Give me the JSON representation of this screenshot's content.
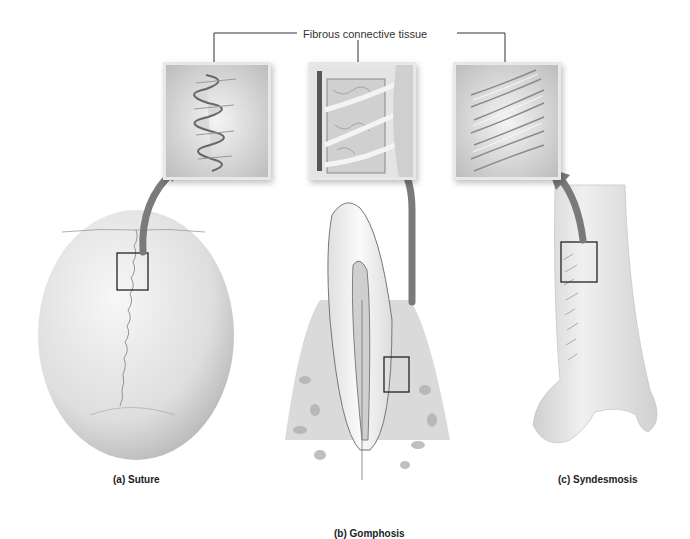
{
  "figure": {
    "callout": {
      "label": "Fibrous connective tissue"
    },
    "panels": [
      {
        "id": "a",
        "caption": "(a) Suture",
        "structure": "skull",
        "inset": "interlocking suture fibers"
      },
      {
        "id": "b",
        "caption": "(b) Gomphosis",
        "structure": "tooth in alveolar bone",
        "inset": "periodontal ligament fibers"
      },
      {
        "id": "c",
        "caption": "(c) Syndesmosis",
        "structure": "tibia and fibula",
        "inset": "interosseous membrane fibers"
      }
    ],
    "colors": {
      "background": "#ffffff",
      "bone": "#e6e6e6",
      "arrow": "#7a7a7a",
      "leader_line": "#333333",
      "highlight_box": "#222222"
    }
  }
}
